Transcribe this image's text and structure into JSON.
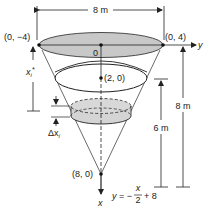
{
  "figure": {
    "type": "conical tank diagram",
    "colors": {
      "fill_top": "#c8c8c8",
      "fill_slice": "#d4d4d4",
      "line": "#222222",
      "background": "#ffffff"
    },
    "labels": {
      "top_width": "8 m",
      "point_left": "(0, −4)",
      "point_right": "(0, 4)",
      "origin": "0",
      "y_axis": "y",
      "x_axis": "x",
      "water_center": "(2, 0)",
      "apex": "(8, 0)",
      "xi_star_base": "x",
      "xi_star_sub": "i",
      "xi_star_sup": "*",
      "delta_x": "Δx",
      "delta_x_sub": "i",
      "depth_water": "6 m",
      "depth_tank": "8 m",
      "equation_lhs": "y = −",
      "equation_num": "x",
      "equation_den": "2",
      "equation_rhs": "+ 8"
    }
  }
}
